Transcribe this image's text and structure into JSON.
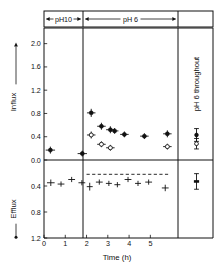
{
  "figure": {
    "title": "",
    "x_axis_title": "Time  (h)",
    "influx_axis_label": "Influx",
    "efflux_axis_label": "Efflux",
    "right_panel_label": "pH 6 throughout"
  },
  "annotations": {
    "phase1_label": "pH10",
    "phase2_label": "pH 6"
  },
  "axis": {
    "x_ticks": [
      "0",
      "1",
      "2",
      "3",
      "4",
      "5"
    ],
    "influx_ticks": [
      "2.0",
      "1.6",
      "1.2",
      "0.8",
      "0.4",
      "0.0"
    ],
    "efflux_ticks": [
      "0.4",
      "0.8",
      "1.2"
    ]
  },
  "chart_data": {
    "type": "scatter",
    "title": "",
    "xlabel": "Time (h)",
    "ylabel": "Influx / Efflux",
    "xlim": [
      0,
      6.3
    ],
    "influx_ylim": [
      0.0,
      2.2
    ],
    "efflux_ylim": [
      0.0,
      1.2
    ],
    "grid": false,
    "legend": "none",
    "phase_boundaries": [
      2.0,
      5.95
    ],
    "phases": [
      {
        "label": "pH10",
        "from": 0.0,
        "to": 2.0
      },
      {
        "label": "pH 6",
        "from": 2.0,
        "to": 5.95
      }
    ],
    "efflux_reference_line": {
      "value": 0.22,
      "style": "dashed",
      "from": 2.0,
      "to": 5.85
    },
    "series": [
      {
        "name": "influx-filled",
        "panel": "influx",
        "marker": "filled-circle",
        "points": [
          {
            "x": 0.3,
            "y": 0.17,
            "xerr": 0.22,
            "yerr": 0.06
          },
          {
            "x": 1.8,
            "y": 0.11,
            "xerr": 0.22,
            "yerr": 0.05
          },
          {
            "x": 2.22,
            "y": 0.81,
            "xerr": 0.2,
            "yerr": 0.07
          },
          {
            "x": 2.7,
            "y": 0.58,
            "xerr": 0.2,
            "yerr": 0.06
          },
          {
            "x": 3.12,
            "y": 0.52,
            "xerr": 0.2,
            "yerr": 0.06
          },
          {
            "x": 3.32,
            "y": 0.5,
            "xerr": 0.18,
            "yerr": 0.05
          },
          {
            "x": 3.78,
            "y": 0.44,
            "xerr": 0.2,
            "yerr": 0.05
          },
          {
            "x": 4.72,
            "y": 0.41,
            "xerr": 0.2,
            "yerr": 0.05
          },
          {
            "x": 5.8,
            "y": 0.45,
            "xerr": 0.2,
            "yerr": 0.06
          }
        ]
      },
      {
        "name": "influx-open",
        "panel": "influx",
        "marker": "open-circle",
        "points": [
          {
            "x": 2.22,
            "y": 0.43,
            "xerr": 0.2,
            "yerr": 0.06
          },
          {
            "x": 2.7,
            "y": 0.27,
            "xerr": 0.2,
            "yerr": 0.05
          },
          {
            "x": 3.12,
            "y": 0.21,
            "xerr": 0.2,
            "yerr": 0.05
          },
          {
            "x": 5.8,
            "y": 0.23,
            "xerr": 0.2,
            "yerr": 0.05
          }
        ]
      },
      {
        "name": "efflux",
        "panel": "efflux",
        "marker": "plus",
        "points": [
          {
            "x": 0.32,
            "y": 0.35,
            "xerr": 0.18,
            "yerr": 0.05
          },
          {
            "x": 0.8,
            "y": 0.37,
            "xerr": 0.16,
            "yerr": 0.04
          },
          {
            "x": 1.3,
            "y": 0.3,
            "xerr": 0.16,
            "yerr": 0.04
          },
          {
            "x": 1.78,
            "y": 0.35,
            "xerr": 0.16,
            "yerr": 0.04
          },
          {
            "x": 2.15,
            "y": 0.41,
            "xerr": 0.14,
            "yerr": 0.06
          },
          {
            "x": 2.6,
            "y": 0.34,
            "xerr": 0.16,
            "yerr": 0.04
          },
          {
            "x": 3.05,
            "y": 0.36,
            "xerr": 0.14,
            "yerr": 0.04
          },
          {
            "x": 3.45,
            "y": 0.38,
            "xerr": 0.14,
            "yerr": 0.04
          },
          {
            "x": 3.95,
            "y": 0.3,
            "xerr": 0.16,
            "yerr": 0.04
          },
          {
            "x": 4.42,
            "y": 0.36,
            "xerr": 0.14,
            "yerr": 0.04
          },
          {
            "x": 4.92,
            "y": 0.34,
            "xerr": 0.16,
            "yerr": 0.04
          },
          {
            "x": 5.7,
            "y": 0.43,
            "xerr": 0.16,
            "yerr": 0.05
          }
        ]
      },
      {
        "name": "control-influx-filled",
        "panel": "influx",
        "region": "right-panel",
        "marker": "filled-circle",
        "points": [
          {
            "x": 0.5,
            "y": 0.43,
            "yerr": 0.11
          }
        ]
      },
      {
        "name": "control-influx-open",
        "panel": "influx",
        "region": "right-panel",
        "marker": "open-circle",
        "points": [
          {
            "x": 0.5,
            "y": 0.28,
            "yerr": 0.09
          }
        ]
      },
      {
        "name": "control-efflux",
        "panel": "efflux",
        "region": "right-panel",
        "marker": "bar",
        "points": [
          {
            "x": 0.5,
            "y": 0.33,
            "yerr": 0.12
          }
        ]
      }
    ]
  }
}
